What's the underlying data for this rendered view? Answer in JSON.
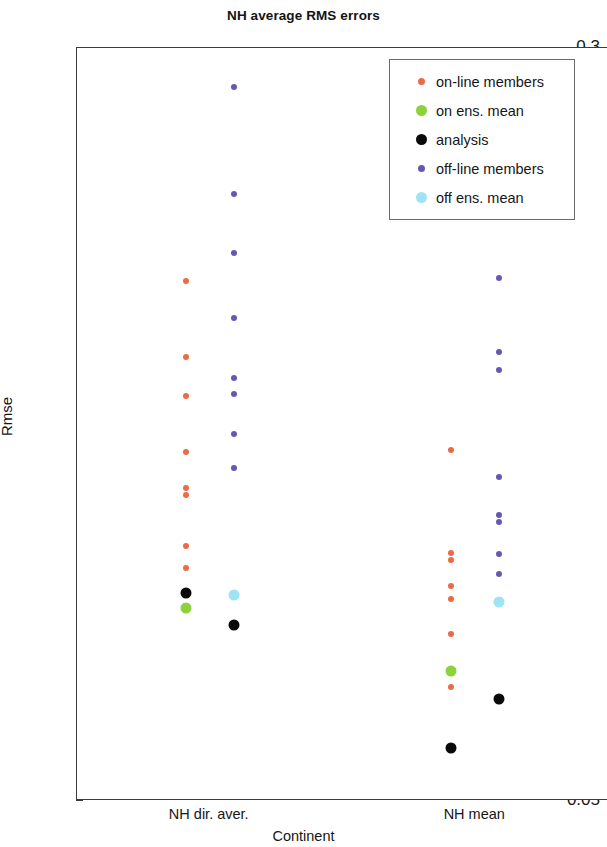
{
  "chart_data": {
    "type": "scatter",
    "title": "NH average RMS errors",
    "xlabel": "Continent",
    "ylabel": "Rmse",
    "categories": [
      "NH dir. aver.",
      "NH mean"
    ],
    "ylim": [
      0.05,
      0.3
    ],
    "yticks": [
      "0.05",
      "0.1",
      "0.15",
      "0.2",
      "0.25",
      "0.3"
    ],
    "ytick_values": [
      0.05,
      0.1,
      0.15,
      0.2,
      0.25,
      0.3
    ],
    "grid": false,
    "legend_position": "top-right",
    "series": [
      {
        "name": "on-line members",
        "color": "#ec6a45",
        "marker": "circle",
        "size": 6,
        "points": [
          {
            "category": "NH dir. aver.",
            "x_offset": -0.09,
            "value": 0.2225
          },
          {
            "category": "NH dir. aver.",
            "x_offset": -0.09,
            "value": 0.1975
          },
          {
            "category": "NH dir. aver.",
            "x_offset": -0.09,
            "value": 0.1845
          },
          {
            "category": "NH dir. aver.",
            "x_offset": -0.09,
            "value": 0.166
          },
          {
            "category": "NH dir. aver.",
            "x_offset": -0.09,
            "value": 0.154
          },
          {
            "category": "NH dir. aver.",
            "x_offset": -0.09,
            "value": 0.1515
          },
          {
            "category": "NH dir. aver.",
            "x_offset": -0.09,
            "value": 0.1345
          },
          {
            "category": "NH dir. aver.",
            "x_offset": -0.09,
            "value": 0.1275
          },
          {
            "category": "NH mean",
            "x_offset": -0.09,
            "value": 0.1665
          },
          {
            "category": "NH mean",
            "x_offset": -0.09,
            "value": 0.1325
          },
          {
            "category": "NH mean",
            "x_offset": -0.09,
            "value": 0.13
          },
          {
            "category": "NH mean",
            "x_offset": -0.09,
            "value": 0.1215
          },
          {
            "category": "NH mean",
            "x_offset": -0.09,
            "value": 0.117
          },
          {
            "category": "NH mean",
            "x_offset": -0.09,
            "value": 0.1055
          },
          {
            "category": "NH mean",
            "x_offset": -0.09,
            "value": 0.088
          }
        ]
      },
      {
        "name": "on ens. mean",
        "color": "#8dd13c",
        "marker": "circle",
        "size": 11,
        "points": [
          {
            "category": "NH dir. aver.",
            "x_offset": -0.09,
            "value": 0.114
          },
          {
            "category": "NH mean",
            "x_offset": -0.09,
            "value": 0.093
          }
        ]
      },
      {
        "name": "analysis",
        "color": "#0a0a0a",
        "marker": "circle",
        "size": 11,
        "points": [
          {
            "category": "NH dir. aver.",
            "x_offset": -0.09,
            "value": 0.119
          },
          {
            "category": "NH dir. aver.",
            "x_offset": 0.09,
            "value": 0.1085
          },
          {
            "category": "NH mean",
            "x_offset": -0.09,
            "value": 0.0675
          },
          {
            "category": "NH mean",
            "x_offset": 0.09,
            "value": 0.084
          }
        ]
      },
      {
        "name": "off-line members",
        "color": "#6558b4",
        "marker": "circle",
        "size": 6,
        "points": [
          {
            "category": "NH dir. aver.",
            "x_offset": 0.09,
            "value": 0.287
          },
          {
            "category": "NH dir. aver.",
            "x_offset": 0.09,
            "value": 0.2515
          },
          {
            "category": "NH dir. aver.",
            "x_offset": 0.09,
            "value": 0.232
          },
          {
            "category": "NH dir. aver.",
            "x_offset": 0.09,
            "value": 0.2105
          },
          {
            "category": "NH dir. aver.",
            "x_offset": 0.09,
            "value": 0.1905
          },
          {
            "category": "NH dir. aver.",
            "x_offset": 0.09,
            "value": 0.185
          },
          {
            "category": "NH dir. aver.",
            "x_offset": 0.09,
            "value": 0.172
          },
          {
            "category": "NH dir. aver.",
            "x_offset": 0.09,
            "value": 0.1605
          },
          {
            "category": "NH mean",
            "x_offset": 0.09,
            "value": 0.2235
          },
          {
            "category": "NH mean",
            "x_offset": 0.09,
            "value": 0.199
          },
          {
            "category": "NH mean",
            "x_offset": 0.09,
            "value": 0.193
          },
          {
            "category": "NH mean",
            "x_offset": 0.09,
            "value": 0.1575
          },
          {
            "category": "NH mean",
            "x_offset": 0.09,
            "value": 0.145
          },
          {
            "category": "NH mean",
            "x_offset": 0.09,
            "value": 0.1425
          },
          {
            "category": "NH mean",
            "x_offset": 0.09,
            "value": 0.132
          },
          {
            "category": "NH mean",
            "x_offset": 0.09,
            "value": 0.1255
          }
        ]
      },
      {
        "name": "off ens. mean",
        "color": "#9fe4f5",
        "marker": "circle",
        "size": 11,
        "points": [
          {
            "category": "NH dir. aver.",
            "x_offset": 0.09,
            "value": 0.1185
          },
          {
            "category": "NH mean",
            "x_offset": 0.09,
            "value": 0.116
          }
        ]
      }
    ]
  },
  "legend": {
    "items": [
      {
        "label": "on-line members",
        "color": "#ec6a45",
        "size": 7
      },
      {
        "label": "on ens. mean",
        "color": "#8dd13c",
        "size": 11
      },
      {
        "label": "analysis",
        "color": "#0a0a0a",
        "size": 11
      },
      {
        "label": "off-line members",
        "color": "#6558b4",
        "size": 7
      },
      {
        "label": "off ens. mean",
        "color": "#9fe4f5",
        "size": 11
      }
    ]
  }
}
